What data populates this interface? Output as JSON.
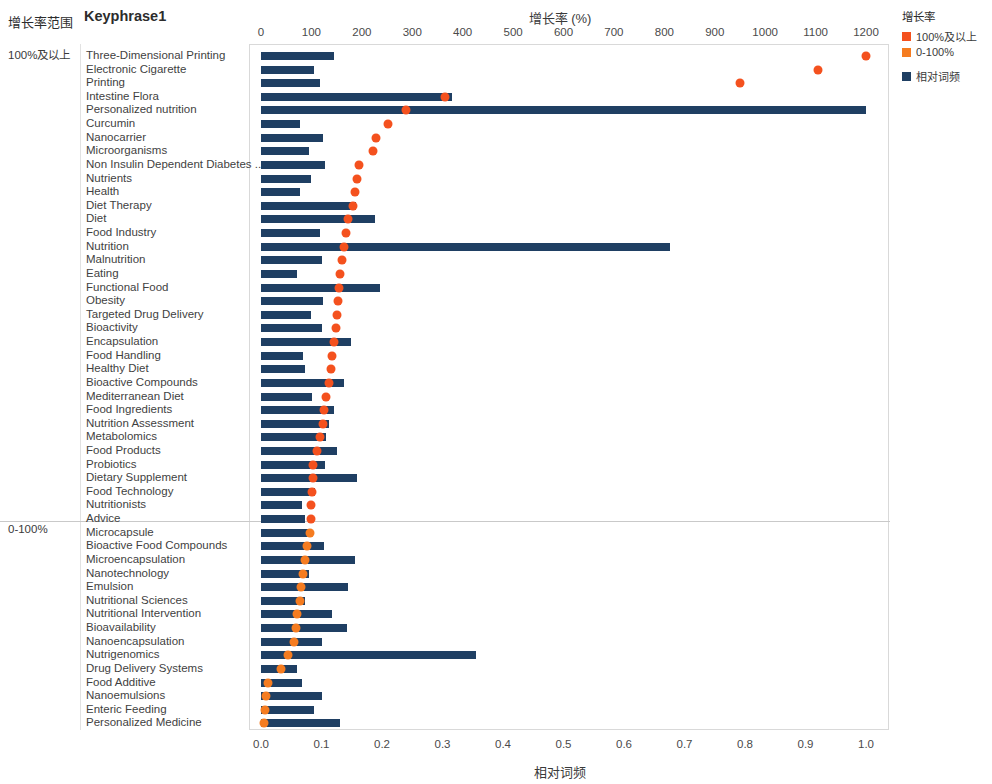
{
  "header": {
    "range_column_label": "增长率范围",
    "keyphrase_column_label": "Keyphrase1"
  },
  "groups": [
    {
      "id": "high",
      "label": "100%及以上"
    },
    {
      "id": "low",
      "label": "0-100%"
    }
  ],
  "legend": {
    "title": "增长率",
    "items": [
      {
        "label": "100%及以上",
        "color": "#f4511e",
        "shape": "square"
      },
      {
        "label": "0-100%",
        "color": "#f57c20",
        "shape": "square"
      },
      {
        "label": "相对词频",
        "color": "#1f3f63",
        "shape": "square"
      }
    ]
  },
  "chart_data": {
    "type": "bar",
    "title": "",
    "xlabel_top": "增长率 (%)",
    "xlabel_bottom": "相对词频",
    "ylabel": "Keyphrase1",
    "grid": false,
    "legend_position": "right",
    "top_axis": {
      "name": "增长率 (%)",
      "range": [
        0,
        1200
      ],
      "ticks": [
        0,
        100,
        200,
        300,
        400,
        500,
        600,
        700,
        800,
        900,
        1000,
        1100,
        1200
      ],
      "tick_labels": [
        "0",
        "100",
        "200",
        "300",
        "400",
        "500",
        "600",
        "700",
        "800",
        "900",
        "1000",
        "1100",
        "1200"
      ]
    },
    "bottom_axis": {
      "name": "相对词频",
      "range": [
        0.0,
        1.0
      ],
      "ticks": [
        0.0,
        0.1,
        0.2,
        0.3,
        0.4,
        0.5,
        0.6,
        0.7,
        0.8,
        0.9,
        1.0
      ],
      "tick_labels": [
        "0.0",
        "0.1",
        "0.2",
        "0.3",
        "0.4",
        "0.5",
        "0.6",
        "0.7",
        "0.8",
        "0.9",
        "1.0"
      ]
    },
    "series": [
      {
        "name": "相对词频",
        "type": "bar",
        "axis": "bottom",
        "color": "#1f3f63"
      },
      {
        "name": "增长率",
        "type": "scatter",
        "axis": "top",
        "color": "#f4511e"
      }
    ],
    "categories": [
      "Three-Dimensional Printing",
      "Electronic Cigarette",
      "Printing",
      "Intestine Flora",
      "Personalized nutrition",
      "Curcumin",
      "Nanocarrier",
      "Microorganisms",
      "Non Insulin Dependent Diabetes ..",
      "Nutrients",
      "Health",
      "Diet Therapy",
      "Diet",
      "Food Industry",
      "Nutrition",
      "Malnutrition",
      "Eating",
      "Functional Food",
      "Obesity",
      "Targeted Drug Delivery",
      "Bioactivity",
      "Encapsulation",
      "Food Handling",
      "Healthy Diet",
      "Bioactive Compounds",
      "Mediterranean Diet",
      "Food Ingredients",
      "Nutrition Assessment",
      "Metabolomics",
      "Food Products",
      "Probiotics",
      "Dietary Supplement",
      "Food Technology",
      "Nutritionists",
      "Advice",
      "Microcapsule",
      "Bioactive Food Compounds",
      "Microencapsulation",
      "Nanotechnology",
      "Emulsion",
      "Nutritional Sciences",
      "Nutritional Intervention",
      "Bioavailability",
      "Nanoencapsulation",
      "Nutrigenomics",
      "Drug Delivery Systems",
      "Food Additive",
      "Nanoemulsions",
      "Enteric Feeding",
      "Personalized Medicine"
    ],
    "rows": [
      {
        "keyphrase": "Three-Dimensional Printing",
        "freq": 0.12,
        "growth": 1200,
        "group": "high"
      },
      {
        "keyphrase": "Electronic Cigarette",
        "freq": 0.088,
        "growth": 1105,
        "group": "high"
      },
      {
        "keyphrase": "Printing",
        "freq": 0.097,
        "growth": 950,
        "group": "high"
      },
      {
        "keyphrase": "Intestine Flora",
        "freq": 0.315,
        "growth": 365,
        "group": "high"
      },
      {
        "keyphrase": "Personalized nutrition",
        "freq": 1.0,
        "growth": 287,
        "group": "high"
      },
      {
        "keyphrase": "Curcumin",
        "freq": 0.065,
        "growth": 252,
        "group": "high"
      },
      {
        "keyphrase": "Nanocarrier",
        "freq": 0.102,
        "growth": 228,
        "group": "high"
      },
      {
        "keyphrase": "Microorganisms",
        "freq": 0.08,
        "growth": 222,
        "group": "high"
      },
      {
        "keyphrase": "Non Insulin Dependent Diabetes ..",
        "freq": 0.105,
        "growth": 195,
        "group": "high"
      },
      {
        "keyphrase": "Nutrients",
        "freq": 0.083,
        "growth": 190,
        "group": "high"
      },
      {
        "keyphrase": "Health",
        "freq": 0.065,
        "growth": 186,
        "group": "high"
      },
      {
        "keyphrase": "Diet Therapy",
        "freq": 0.157,
        "growth": 182,
        "group": "high"
      },
      {
        "keyphrase": "Diet",
        "freq": 0.188,
        "growth": 172,
        "group": "high"
      },
      {
        "keyphrase": "Food Industry",
        "freq": 0.098,
        "growth": 168,
        "group": "high"
      },
      {
        "keyphrase": "Nutrition",
        "freq": 0.676,
        "growth": 164,
        "group": "high"
      },
      {
        "keyphrase": "Malnutrition",
        "freq": 0.1,
        "growth": 160,
        "group": "high"
      },
      {
        "keyphrase": "Eating",
        "freq": 0.06,
        "growth": 157,
        "group": "high"
      },
      {
        "keyphrase": "Functional Food",
        "freq": 0.197,
        "growth": 154,
        "group": "high"
      },
      {
        "keyphrase": "Obesity",
        "freq": 0.102,
        "growth": 152,
        "group": "high"
      },
      {
        "keyphrase": "Targeted Drug Delivery",
        "freq": 0.082,
        "growth": 150,
        "group": "high"
      },
      {
        "keyphrase": "Bioactivity",
        "freq": 0.1,
        "growth": 148,
        "group": "high"
      },
      {
        "keyphrase": "Encapsulation",
        "freq": 0.148,
        "growth": 144,
        "group": "high"
      },
      {
        "keyphrase": "Food Handling",
        "freq": 0.07,
        "growth": 141,
        "group": "high"
      },
      {
        "keyphrase": "Healthy Diet",
        "freq": 0.072,
        "growth": 138,
        "group": "high"
      },
      {
        "keyphrase": "Bioactive Compounds",
        "freq": 0.138,
        "growth": 134,
        "group": "high"
      },
      {
        "keyphrase": "Mediterranean Diet",
        "freq": 0.085,
        "growth": 128,
        "group": "high"
      },
      {
        "keyphrase": "Food Ingredients",
        "freq": 0.12,
        "growth": 124,
        "group": "high"
      },
      {
        "keyphrase": "Nutrition Assessment",
        "freq": 0.112,
        "growth": 122,
        "group": "high"
      },
      {
        "keyphrase": "Metabolomics",
        "freq": 0.108,
        "growth": 118,
        "group": "high"
      },
      {
        "keyphrase": "Food Products",
        "freq": 0.125,
        "growth": 112,
        "group": "high"
      },
      {
        "keyphrase": "Probiotics",
        "freq": 0.105,
        "growth": 104,
        "group": "high"
      },
      {
        "keyphrase": "Dietary Supplement",
        "freq": 0.158,
        "growth": 103,
        "group": "high"
      },
      {
        "keyphrase": "Food Technology",
        "freq": 0.09,
        "growth": 101,
        "group": "high"
      },
      {
        "keyphrase": "Nutritionists",
        "freq": 0.068,
        "growth": 100,
        "group": "high"
      },
      {
        "keyphrase": "Advice",
        "freq": 0.072,
        "growth": 100,
        "group": "high"
      },
      {
        "keyphrase": "Microcapsule",
        "freq": 0.078,
        "growth": 97,
        "group": "low"
      },
      {
        "keyphrase": "Bioactive Food Compounds",
        "freq": 0.104,
        "growth": 92,
        "group": "low"
      },
      {
        "keyphrase": "Microencapsulation",
        "freq": 0.155,
        "growth": 88,
        "group": "low"
      },
      {
        "keyphrase": "Nanotechnology",
        "freq": 0.08,
        "growth": 84,
        "group": "low"
      },
      {
        "keyphrase": "Emulsion",
        "freq": 0.143,
        "growth": 80,
        "group": "low"
      },
      {
        "keyphrase": "Nutritional Sciences",
        "freq": 0.073,
        "growth": 77,
        "group": "low"
      },
      {
        "keyphrase": "Nutritional Intervention",
        "freq": 0.118,
        "growth": 72,
        "group": "low"
      },
      {
        "keyphrase": "Bioavailability",
        "freq": 0.142,
        "growth": 69,
        "group": "low"
      },
      {
        "keyphrase": "Nanoencapsulation",
        "freq": 0.1,
        "growth": 65,
        "group": "low"
      },
      {
        "keyphrase": "Nutrigenomics",
        "freq": 0.355,
        "growth": 54,
        "group": "low"
      },
      {
        "keyphrase": "Drug Delivery Systems",
        "freq": 0.06,
        "growth": 39,
        "group": "low"
      },
      {
        "keyphrase": "Food Additive",
        "freq": 0.068,
        "growth": 14,
        "group": "low"
      },
      {
        "keyphrase": "Nanoemulsions",
        "freq": 0.1,
        "growth": 10,
        "group": "low"
      },
      {
        "keyphrase": "Enteric Feeding",
        "freq": 0.088,
        "growth": 8,
        "group": "low"
      },
      {
        "keyphrase": "Personalized Medicine",
        "freq": 0.13,
        "growth": 6,
        "group": "low"
      }
    ]
  }
}
